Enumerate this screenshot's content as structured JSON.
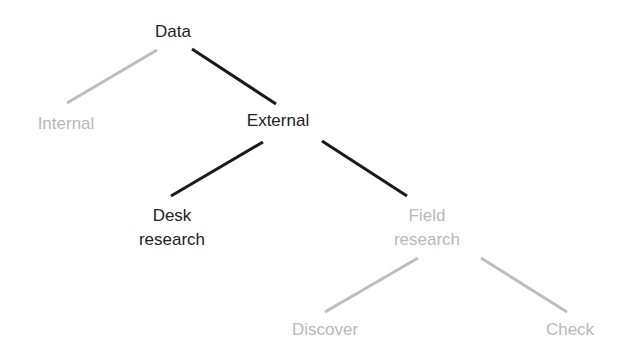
{
  "colors": {
    "active": "#1a1a1a",
    "inactive": "#bdbdbd",
    "active_text": "#222222",
    "inactive_text": "#b8b8b8"
  },
  "tree": {
    "nodes": [
      {
        "id": "data",
        "lines": [
          "Data"
        ],
        "active": true
      },
      {
        "id": "internal",
        "lines": [
          "Internal"
        ],
        "active": false
      },
      {
        "id": "external",
        "lines": [
          "External"
        ],
        "active": true
      },
      {
        "id": "desk",
        "lines": [
          "Desk",
          "research"
        ],
        "active": true
      },
      {
        "id": "field",
        "lines": [
          "Field",
          "research"
        ],
        "active": false
      },
      {
        "id": "discover",
        "lines": [
          "Discover"
        ],
        "active": false
      },
      {
        "id": "check",
        "lines": [
          "Check"
        ],
        "active": false
      }
    ],
    "edges": [
      {
        "from": "data",
        "to": "internal",
        "active": false
      },
      {
        "from": "data",
        "to": "external",
        "active": true
      },
      {
        "from": "external",
        "to": "desk",
        "active": true
      },
      {
        "from": "external",
        "to": "field",
        "active": true
      },
      {
        "from": "field",
        "to": "discover",
        "active": false
      },
      {
        "from": "field",
        "to": "check",
        "active": false
      }
    ]
  }
}
